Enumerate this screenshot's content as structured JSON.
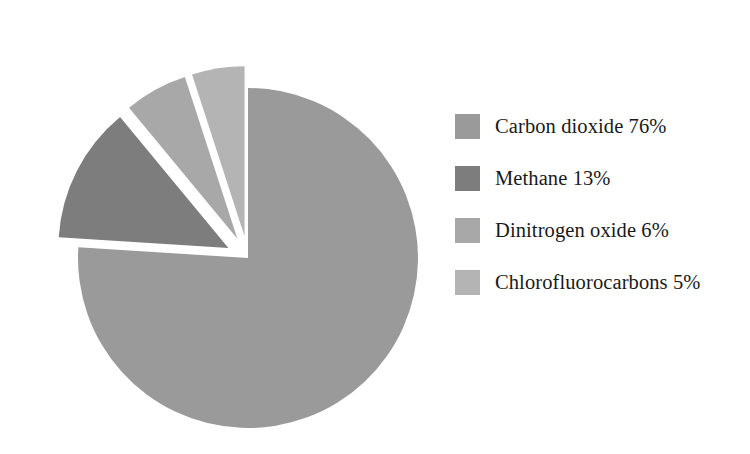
{
  "chart_data": {
    "type": "pie",
    "title": "",
    "subtitle": "",
    "xlabel": "",
    "ylabel": "",
    "grid": false,
    "legend_position": "right",
    "unit": "%",
    "categories": [
      "Carbon dioxide",
      "Methane",
      "Dinitrogen oxide",
      "Chlorofluorocarbons"
    ],
    "values": [
      76,
      13,
      6,
      5
    ],
    "colors": [
      "#9a9a9a",
      "#7d7d7d",
      "#a8a8a8",
      "#b4b4b4"
    ],
    "exploded": [
      false,
      true,
      true,
      true
    ],
    "start_angle_deg": 0,
    "direction": "clockwise",
    "slices": [
      {
        "label": "Carbon dioxide",
        "value": 76,
        "value_text": "76%",
        "legend_text": "Carbon dioxide 76%",
        "color": "#9a9a9a",
        "exploded": false,
        "explode_offset": 0,
        "start_deg": 0,
        "end_deg": 273.6
      },
      {
        "label": "Methane",
        "value": 13,
        "value_text": "13%",
        "legend_text": "Methane 13%",
        "color": "#7d7d7d",
        "exploded": true,
        "explode_offset": 22,
        "start_deg": 273.6,
        "end_deg": 320.4
      },
      {
        "label": "Dinitrogen oxide",
        "value": 6,
        "value_text": "6%",
        "legend_text": "Dinitrogen oxide 6%",
        "color": "#a8a8a8",
        "exploded": true,
        "explode_offset": 22,
        "start_deg": 320.4,
        "end_deg": 342.0
      },
      {
        "label": "Chlorofluorocarbons",
        "value": 5,
        "value_text": "5%",
        "legend_text": "Chlorofluorocarbons 5%",
        "color": "#b4b4b4",
        "exploded": true,
        "explode_offset": 22,
        "start_deg": 342.0,
        "end_deg": 360.0
      }
    ],
    "geometry": {
      "center_x": 248,
      "center_y": 258,
      "radius": 170
    },
    "background_color": "#ffffff",
    "text_color": "#1a1a1a"
  },
  "legend": {
    "items": [
      {
        "label": "Carbon dioxide 76%",
        "color": "#9a9a9a"
      },
      {
        "label": "Methane 13%",
        "color": "#7d7d7d"
      },
      {
        "label": "Dinitrogen oxide 6%",
        "color": "#a8a8a8"
      },
      {
        "label": "Chlorofluorocarbons 5%",
        "color": "#b4b4b4"
      }
    ]
  }
}
